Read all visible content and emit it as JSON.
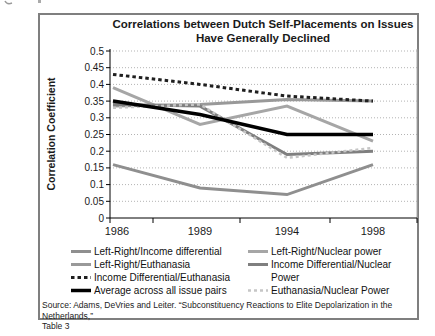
{
  "chart_data": {
    "type": "line",
    "title": "Correlations between Dutch Self-Placements on Issues Have Generally Declined",
    "ylabel": "Correlation Coefficient",
    "xlabel": "",
    "categories": [
      "1986",
      "1989",
      "1994",
      "1998"
    ],
    "ylim": [
      0,
      0.5
    ],
    "ytick_labels": [
      "0",
      "0.05",
      "0.1",
      "0.15",
      "0.2",
      "0.25",
      "0.3",
      "0.35",
      "0.4",
      "0.45",
      "0.5"
    ],
    "grid": "horizontal dotted gridlines",
    "legend_position": "bottom, two columns",
    "colors": {
      "gridline": "#b3b3b3",
      "axis": "#000000",
      "plot_right_border": "#aaaaaa",
      "figure_border": "#808080",
      "background": "#ffffff"
    },
    "series": [
      {
        "name": "Left-Right/Income differential",
        "values": [
          0.16,
          0.09,
          0.07,
          0.16
        ],
        "color": "#8f8f8f",
        "dash": "",
        "width": 3
      },
      {
        "name": "Left-Right/Nuclear power",
        "values": [
          0.39,
          0.28,
          0.335,
          0.23
        ],
        "color": "#a6a6a6",
        "dash": "",
        "width": 3
      },
      {
        "name": "Left-Right/Euthanasia",
        "values": [
          0.335,
          0.34,
          0.355,
          0.35
        ],
        "color": "#999999",
        "dash": "",
        "width": 3
      },
      {
        "name": "Income Differential/Nuclear Power",
        "values": [
          0.34,
          0.335,
          0.19,
          0.2
        ],
        "color": "#7f7f7f",
        "dash": "",
        "width": 3
      },
      {
        "name": "Income Differential/Euthanasia",
        "values": [
          0.43,
          0.4,
          0.365,
          0.35
        ],
        "color": "#1f1f1f",
        "dash": "3.5 3",
        "width": 3
      },
      {
        "name": "Average across all issue pairs",
        "values": [
          0.35,
          0.31,
          0.25,
          0.25
        ],
        "color": "#000000",
        "dash": "",
        "width": 3.5
      },
      {
        "name": "Euthanasia/Nuclear Power",
        "values": [
          0.33,
          0.34,
          0.18,
          0.21
        ],
        "color": "#c6c6c6",
        "dash": "3 3",
        "width": 2.5
      }
    ],
    "legend_columns": [
      [
        0,
        2,
        4,
        5
      ],
      [
        1,
        3,
        6
      ]
    ]
  },
  "source_note": {
    "line1": "Source: Adams, DeVries and Leiter. “Subconstituency Reactions to Elite Depolarization in the Netherlands,”",
    "line2": "Table 3"
  }
}
